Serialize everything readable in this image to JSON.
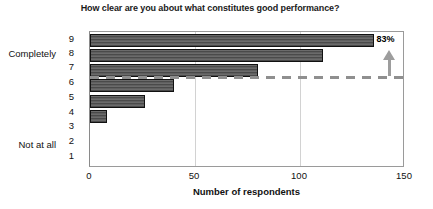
{
  "chart_data": {
    "type": "bar",
    "orientation": "horizontal",
    "title": "How clear are you about what constitutes good performance?",
    "xlabel": "Number of respondents",
    "ylabel": "",
    "categories": [
      "9",
      "8",
      "7",
      "6",
      "5",
      "4",
      "3",
      "2",
      "1"
    ],
    "values": [
      135,
      111,
      80,
      40,
      26,
      8,
      0,
      0,
      0
    ],
    "xlim": [
      0,
      150
    ],
    "xticks": [
      0,
      50,
      100,
      150
    ],
    "xtick_labels": [
      "0",
      "50",
      "100",
      "150"
    ],
    "grid": "vertical-light",
    "legend": "none",
    "scale_anchor_high": "Completely",
    "scale_anchor_low": "Not at all",
    "annotations": [
      {
        "name": "data-label",
        "text": "83%",
        "attached_to_category": "9"
      },
      {
        "name": "threshold-dashed-line",
        "text": "",
        "between_categories": [
          "7",
          "6"
        ]
      },
      {
        "name": "up-arrow",
        "text": ""
      }
    ]
  },
  "chart": {
    "title": "How clear are you about what constitutes good performance?",
    "xlabel": "Number of respondents",
    "anchor_high": "Completely",
    "anchor_low": "Not at all",
    "percent_label": "83%",
    "ytick_9": "9",
    "ytick_8": "8",
    "ytick_7": "7",
    "ytick_6": "6",
    "ytick_5": "5",
    "ytick_4": "4",
    "ytick_3": "3",
    "ytick_2": "2",
    "ytick_1": "1",
    "xtick_0": "0",
    "xtick_50": "50",
    "xtick_100": "100",
    "xtick_150": "150",
    "colors": {
      "bar_fill": "#5f5f5f",
      "bar_border": "#111111",
      "dashed_line": "#8f8f8f",
      "arrow": "#9d9d9d",
      "frame": "#9a9a9a",
      "gridline": "#d2d2d2",
      "text": "#111111"
    }
  }
}
